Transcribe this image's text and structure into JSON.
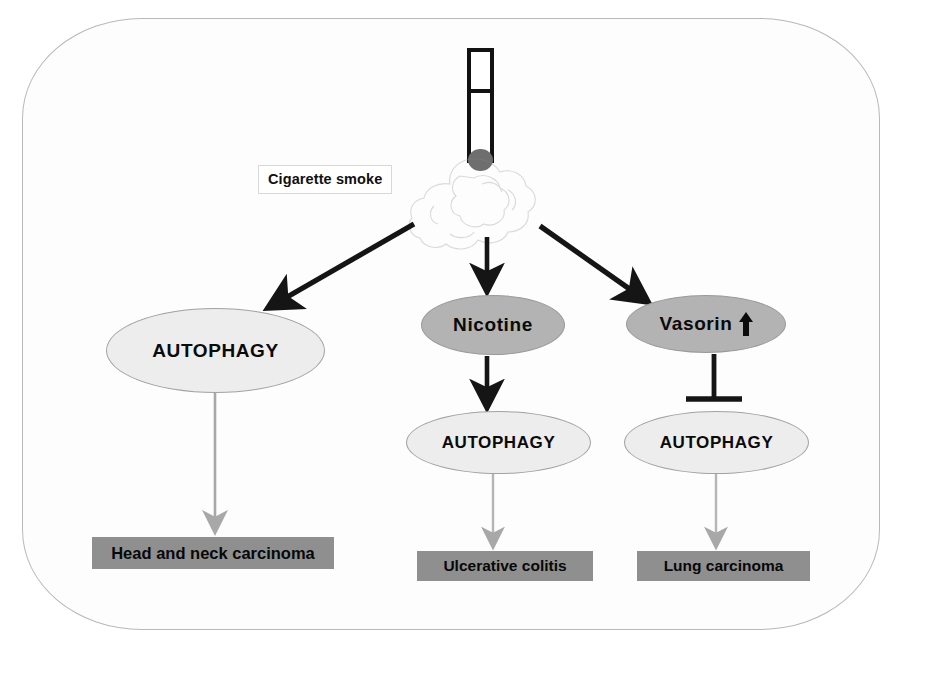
{
  "figure": {
    "type": "pathway-diagram",
    "title_label": "Cigarette smoke",
    "source": {
      "icon": "cigarette-icon",
      "smoke_icon": "smoke-cloud-icon",
      "label": "Cigarette smoke"
    },
    "nodes": [
      {
        "id": "autophagy-left",
        "label": "AUTOPHAGY",
        "shape": "ellipse",
        "fill": "#ededed"
      },
      {
        "id": "nicotine",
        "label": "Nicotine",
        "shape": "ellipse",
        "fill": "#b3b3b3"
      },
      {
        "id": "vasorin",
        "label": "Vasorin",
        "shape": "ellipse",
        "fill": "#b3b3b3",
        "badge": "↑",
        "badge_name": "up-regulation-arrow"
      },
      {
        "id": "autophagy-mid",
        "label": "AUTOPHAGY",
        "shape": "ellipse",
        "fill": "#ededed"
      },
      {
        "id": "autophagy-right",
        "label": "AUTOPHAGY",
        "shape": "ellipse",
        "fill": "#ededed"
      }
    ],
    "outcomes": [
      {
        "id": "head-neck",
        "label": "Head and neck carcinoma",
        "fill": "#8f8f8f"
      },
      {
        "id": "ulcerative",
        "label": "Ulcerative colitis",
        "fill": "#8f8f8f"
      },
      {
        "id": "lung",
        "label": "Lung carcinoma",
        "fill": "#8f8f8f"
      }
    ],
    "edges": [
      {
        "from": "cigarette-smoke",
        "to": "autophagy-left",
        "style": "arrow",
        "color": "#151515"
      },
      {
        "from": "cigarette-smoke",
        "to": "nicotine",
        "style": "arrow",
        "color": "#151515"
      },
      {
        "from": "cigarette-smoke",
        "to": "vasorin",
        "style": "arrow",
        "color": "#151515"
      },
      {
        "from": "autophagy-left",
        "to": "head-neck",
        "style": "arrow",
        "color": "#9a9a9a"
      },
      {
        "from": "nicotine",
        "to": "autophagy-mid",
        "style": "arrow",
        "color": "#151515"
      },
      {
        "from": "autophagy-mid",
        "to": "ulcerative",
        "style": "arrow",
        "color": "#b5b5b5"
      },
      {
        "from": "vasorin",
        "to": "autophagy-right",
        "style": "inhibition",
        "color": "#151515"
      },
      {
        "from": "autophagy-right",
        "to": "lung",
        "style": "arrow",
        "color": "#b5b5b5"
      }
    ],
    "colors": {
      "frame_border": "#b9b9b9",
      "ellipse_light": "#ededed",
      "ellipse_mid": "#b3b3b3",
      "box_fill": "#8f8f8f",
      "arrow_black": "#151515",
      "arrow_gray": "#a8a8a8"
    }
  }
}
